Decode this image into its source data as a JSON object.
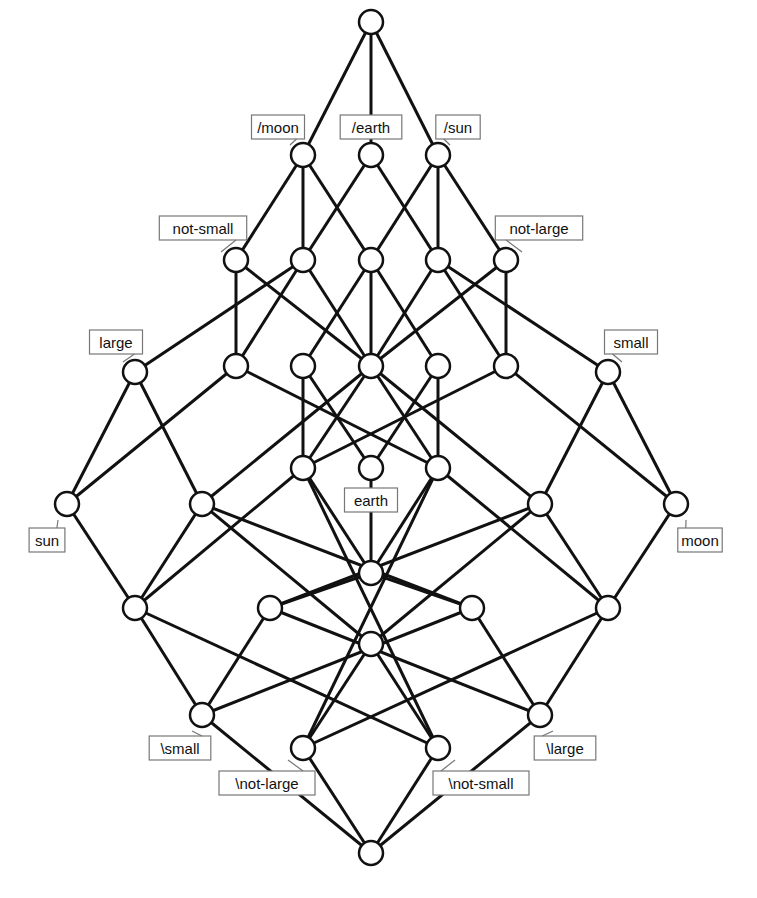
{
  "diagram": {
    "type": "concept-lattice",
    "node_radius": 12,
    "colors": {
      "line": "#111111",
      "fill_dark": "#111111",
      "fill_light": "#ffffff",
      "label_border": "#777777"
    },
    "nodes": [
      {
        "id": "top",
        "x": 371,
        "y": 22,
        "fill": "none"
      },
      {
        "id": "moon_inv",
        "x": 303,
        "y": 155,
        "fill": "top",
        "label": "/moon",
        "lx": 278,
        "ly": 127,
        "lax": 290,
        "lay": 145
      },
      {
        "id": "earth_inv",
        "x": 371,
        "y": 155,
        "fill": "top",
        "label": "/earth",
        "lx": 371,
        "ly": 127,
        "lax": 371,
        "lay": 143
      },
      {
        "id": "sun_inv",
        "x": 438,
        "y": 155,
        "fill": "top",
        "label": "/sun",
        "lx": 458,
        "ly": 127,
        "lax": 450,
        "lay": 145
      },
      {
        "id": "not_small",
        "x": 236,
        "y": 260,
        "fill": "top",
        "label": "not-small",
        "lx": 203,
        "ly": 228,
        "lax": 221,
        "lay": 252
      },
      {
        "id": "n2b",
        "x": 303,
        "y": 260,
        "fill": "none"
      },
      {
        "id": "n2c",
        "x": 371,
        "y": 260,
        "fill": "none"
      },
      {
        "id": "n2d",
        "x": 438,
        "y": 260,
        "fill": "none"
      },
      {
        "id": "not_large",
        "x": 506,
        "y": 260,
        "fill": "top",
        "label": "not-large",
        "lx": 539,
        "ly": 228,
        "lax": 522,
        "lay": 252
      },
      {
        "id": "n3a",
        "x": 236,
        "y": 366,
        "fill": "none"
      },
      {
        "id": "n3b",
        "x": 303,
        "y": 366,
        "fill": "none"
      },
      {
        "id": "n3c",
        "x": 371,
        "y": 366,
        "fill": "none"
      },
      {
        "id": "n3d",
        "x": 438,
        "y": 366,
        "fill": "none"
      },
      {
        "id": "n3e",
        "x": 506,
        "y": 366,
        "fill": "none"
      },
      {
        "id": "large",
        "x": 135,
        "y": 372,
        "fill": "top",
        "label": "large",
        "lx": 116,
        "ly": 368,
        "lax": 123,
        "lay": 362,
        "ldy": -30
      },
      {
        "id": "small",
        "x": 608,
        "y": 372,
        "fill": "top",
        "label": "small",
        "lx": 631,
        "ly": 368,
        "lax": 622,
        "lay": 362,
        "ldy": -30
      },
      {
        "id": "n4a",
        "x": 303,
        "y": 468,
        "fill": "none"
      },
      {
        "id": "earth",
        "x": 371,
        "y": 468,
        "fill": "bottom",
        "label": "earth",
        "lx": 371,
        "ly": 500,
        "lax": 371,
        "lay": 480
      },
      {
        "id": "n4c",
        "x": 438,
        "y": 468,
        "fill": "none"
      },
      {
        "id": "sun",
        "x": 67,
        "y": 504,
        "fill": "bottom",
        "label": "sun",
        "lx": 47,
        "ly": 540,
        "lax": 58,
        "lay": 520
      },
      {
        "id": "n5b",
        "x": 202,
        "y": 504,
        "fill": "none"
      },
      {
        "id": "n5c",
        "x": 540,
        "y": 504,
        "fill": "none"
      },
      {
        "id": "moon",
        "x": 676,
        "y": 504,
        "fill": "bottom",
        "label": "moon",
        "lx": 700,
        "ly": 540,
        "lax": 686,
        "lay": 520
      },
      {
        "id": "n6m",
        "x": 371,
        "y": 573,
        "fill": "none"
      },
      {
        "id": "n7a",
        "x": 135,
        "y": 608,
        "fill": "none"
      },
      {
        "id": "n7b",
        "x": 270,
        "y": 608,
        "fill": "none"
      },
      {
        "id": "n7c",
        "x": 472,
        "y": 608,
        "fill": "none"
      },
      {
        "id": "n7d",
        "x": 608,
        "y": 608,
        "fill": "none"
      },
      {
        "id": "n8m",
        "x": 371,
        "y": 644,
        "fill": "none"
      },
      {
        "id": "small_inv",
        "x": 202,
        "y": 715,
        "fill": "bottom",
        "label": "\\small",
        "lx": 180,
        "ly": 748,
        "lax": 192,
        "lay": 731
      },
      {
        "id": "large_inv",
        "x": 540,
        "y": 715,
        "fill": "bottom",
        "label": "\\large",
        "lx": 565,
        "ly": 748,
        "lax": 553,
        "lay": 731
      },
      {
        "id": "not_large_inv",
        "x": 303,
        "y": 748,
        "fill": "bottom",
        "label": "\\not-large",
        "lx": 267,
        "ly": 783,
        "lax": 288,
        "lay": 760
      },
      {
        "id": "not_small_inv",
        "x": 438,
        "y": 748,
        "fill": "bottom",
        "label": "\\not-small",
        "lx": 481,
        "ly": 783,
        "lax": 455,
        "lay": 760
      },
      {
        "id": "bottom",
        "x": 371,
        "y": 853,
        "fill": "none"
      }
    ],
    "edges": [
      [
        "top",
        "moon_inv"
      ],
      [
        "top",
        "earth_inv"
      ],
      [
        "top",
        "sun_inv"
      ],
      [
        "moon_inv",
        "not_small"
      ],
      [
        "moon_inv",
        "n2b"
      ],
      [
        "moon_inv",
        "n2c"
      ],
      [
        "earth_inv",
        "n2b"
      ],
      [
        "earth_inv",
        "n2d"
      ],
      [
        "sun_inv",
        "n2c"
      ],
      [
        "sun_inv",
        "n2d"
      ],
      [
        "sun_inv",
        "not_large"
      ],
      [
        "not_small",
        "n3a"
      ],
      [
        "not_small",
        "n3c"
      ],
      [
        "n2b",
        "n3a"
      ],
      [
        "n2b",
        "large"
      ],
      [
        "n2b",
        "n3c"
      ],
      [
        "n2c",
        "n3b"
      ],
      [
        "n2c",
        "n3c"
      ],
      [
        "n2c",
        "n3d"
      ],
      [
        "n2d",
        "n3c"
      ],
      [
        "n2d",
        "n3e"
      ],
      [
        "n2d",
        "small"
      ],
      [
        "not_large",
        "n3c"
      ],
      [
        "not_large",
        "n3e"
      ],
      [
        "large",
        "sun"
      ],
      [
        "large",
        "n5b"
      ],
      [
        "small",
        "moon"
      ],
      [
        "small",
        "n5c"
      ],
      [
        "n3a",
        "sun"
      ],
      [
        "n3a",
        "n4c"
      ],
      [
        "n3e",
        "moon"
      ],
      [
        "n3e",
        "n4a"
      ],
      [
        "n3b",
        "n4a"
      ],
      [
        "n3b",
        "earth"
      ],
      [
        "n3d",
        "n4c"
      ],
      [
        "n3d",
        "earth"
      ],
      [
        "n3c",
        "n4a"
      ],
      [
        "n3c",
        "n4c"
      ],
      [
        "n3c",
        "n5b"
      ],
      [
        "n3c",
        "n5c"
      ],
      [
        "sun",
        "n7a"
      ],
      [
        "moon",
        "n7d"
      ],
      [
        "n5b",
        "n7a"
      ],
      [
        "n5b",
        "n7c"
      ],
      [
        "n5b",
        "n8m"
      ],
      [
        "n5c",
        "n7d"
      ],
      [
        "n5c",
        "n7b"
      ],
      [
        "n5c",
        "n8m"
      ],
      [
        "n4a",
        "n7a"
      ],
      [
        "n4a",
        "n6m"
      ],
      [
        "n4a",
        "not_small_inv"
      ],
      [
        "n4c",
        "n7d"
      ],
      [
        "n4c",
        "n6m"
      ],
      [
        "n4c",
        "not_large_inv"
      ],
      [
        "earth",
        "n6m"
      ],
      [
        "n6m",
        "n7b"
      ],
      [
        "n6m",
        "n7c"
      ],
      [
        "n7a",
        "small_inv"
      ],
      [
        "n7a",
        "not_small_inv"
      ],
      [
        "n7d",
        "large_inv"
      ],
      [
        "n7d",
        "not_large_inv"
      ],
      [
        "n7b",
        "small_inv"
      ],
      [
        "n7b",
        "large_inv"
      ],
      [
        "n7c",
        "small_inv"
      ],
      [
        "n7c",
        "large_inv"
      ],
      [
        "n8m",
        "not_large_inv"
      ],
      [
        "n8m",
        "not_small_inv"
      ],
      [
        "small_inv",
        "bottom"
      ],
      [
        "large_inv",
        "bottom"
      ],
      [
        "not_large_inv",
        "bottom"
      ],
      [
        "not_small_inv",
        "bottom"
      ]
    ]
  }
}
